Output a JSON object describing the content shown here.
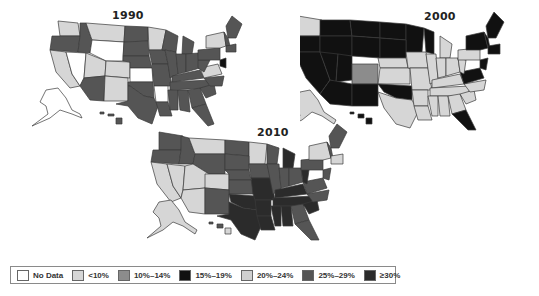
{
  "colors": {
    "no_data": "#ffffff",
    "lt10": "#d6d6d6",
    "p10_14": "#8c8c8c",
    "p15_19": "#111111",
    "p20_24": "#cfcfcf",
    "p25_29": "#555555",
    "ge30": "#2b2b2b",
    "border": "#3a3a3a"
  },
  "maps": [
    {
      "title": "1990",
      "x": 20,
      "y": 6
    },
    {
      "title": "2000",
      "x": 300,
      "y": 8
    },
    {
      "title": "2010",
      "x": 145,
      "y": 122
    }
  ],
  "legend": {
    "items": [
      {
        "label": "No Data",
        "color": "#ffffff"
      },
      {
        "label": "<10%",
        "color": "#d6d6d6"
      },
      {
        "label": "10%–14%",
        "color": "#8c8c8c"
      },
      {
        "label": "15%–19%",
        "color": "#111111"
      },
      {
        "label": "20%–24%",
        "color": "#cfcfcf"
      },
      {
        "label": "25%–29%",
        "color": "#555555"
      },
      {
        "label": "≥30%",
        "color": "#2b2b2b"
      }
    ]
  }
}
